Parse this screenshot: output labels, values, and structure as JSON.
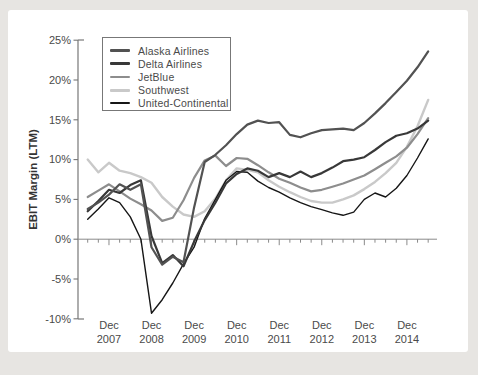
{
  "page": {
    "background": "#e7e5e2",
    "card_background": "#ffffff"
  },
  "chart_data": {
    "type": "line",
    "title": "",
    "xlabel": "",
    "ylabel": "EBIT Margin (LTM)",
    "ylim": [
      -10,
      25
    ],
    "grid": "off",
    "legend_position": "top-left-inside",
    "y_ticks": [
      {
        "value": 25,
        "label": "25%"
      },
      {
        "value": 20,
        "label": "20%"
      },
      {
        "value": 15,
        "label": "15%"
      },
      {
        "value": 10,
        "label": "10%"
      },
      {
        "value": 5,
        "label": "5%"
      },
      {
        "value": 0,
        "label": "0%"
      },
      {
        "value": -5,
        "label": "-5%"
      },
      {
        "value": -10,
        "label": "-10%"
      }
    ],
    "x_ticks": [
      {
        "month": "Dec",
        "year": "2007"
      },
      {
        "month": "Dec",
        "year": "2008"
      },
      {
        "month": "Dec",
        "year": "2009"
      },
      {
        "month": "Dec",
        "year": "2010"
      },
      {
        "month": "Dec",
        "year": "2011"
      },
      {
        "month": "Dec",
        "year": "2012"
      },
      {
        "month": "Dec",
        "year": "2013"
      },
      {
        "month": "Dec",
        "year": "2014"
      }
    ],
    "categories": [
      "Jun-07",
      "Sep-07",
      "Dec-07",
      "Mar-08",
      "Jun-08",
      "Sep-08",
      "Dec-08",
      "Mar-09",
      "Jun-09",
      "Sep-09",
      "Dec-09",
      "Mar-10",
      "Jun-10",
      "Sep-10",
      "Dec-10",
      "Mar-11",
      "Jun-11",
      "Sep-11",
      "Dec-11",
      "Mar-12",
      "Jun-12",
      "Sep-12",
      "Dec-12",
      "Mar-13",
      "Jun-13",
      "Sep-13",
      "Dec-13",
      "Mar-14",
      "Jun-14",
      "Sep-14",
      "Dec-14",
      "Mar-15",
      "Jun-15"
    ],
    "series": [
      {
        "name": "Alaska Airlines",
        "color": "#525252",
        "line_width": 2.2,
        "swatch_height": 2.6,
        "values": [
          3.8,
          4.6,
          5.6,
          6.9,
          6.2,
          6.9,
          -1.0,
          -3.2,
          -2.2,
          -2.9,
          4.0,
          9.7,
          10.6,
          11.8,
          13.2,
          14.4,
          14.9,
          14.6,
          14.7,
          13.1,
          12.8,
          13.3,
          13.7,
          13.8,
          13.9,
          13.7,
          14.6,
          15.8,
          17.1,
          18.5,
          19.9,
          21.6,
          23.6
        ]
      },
      {
        "name": "Delta Airlines",
        "color": "#383838",
        "line_width": 2.2,
        "swatch_height": 2.6,
        "values": [
          3.5,
          4.8,
          6.2,
          5.8,
          6.8,
          7.4,
          0.4,
          -3.0,
          -2.0,
          -3.4,
          -0.3,
          2.4,
          4.6,
          7.0,
          8.2,
          8.9,
          8.6,
          7.8,
          8.3,
          7.8,
          8.5,
          7.8,
          8.3,
          9.0,
          9.8,
          10.0,
          10.3,
          11.2,
          12.2,
          13.0,
          13.3,
          13.9,
          14.9
        ]
      },
      {
        "name": "JetBlue",
        "color": "#8d8d8d",
        "line_width": 2.2,
        "swatch_height": 2.6,
        "values": [
          5.3,
          6.1,
          6.9,
          6.0,
          5.1,
          4.4,
          3.6,
          2.3,
          2.7,
          4.9,
          7.7,
          9.9,
          10.5,
          9.2,
          10.2,
          10.1,
          9.3,
          8.4,
          7.6,
          7.1,
          6.5,
          6.0,
          6.2,
          6.6,
          7.0,
          7.5,
          8.0,
          8.8,
          9.6,
          10.4,
          11.5,
          13.2,
          15.2
        ]
      },
      {
        "name": "Southwest",
        "color": "#c9c9c9",
        "line_width": 2.4,
        "swatch_height": 2.8,
        "values": [
          10.0,
          8.4,
          9.6,
          8.6,
          8.3,
          7.8,
          7.1,
          5.3,
          4.1,
          3.1,
          2.8,
          3.5,
          5.1,
          7.4,
          8.9,
          8.7,
          8.4,
          7.4,
          6.6,
          5.9,
          5.3,
          4.8,
          4.6,
          4.6,
          5.0,
          5.5,
          6.3,
          7.2,
          8.3,
          9.6,
          11.6,
          14.2,
          17.5
        ]
      },
      {
        "name": "United-Continental",
        "color": "#161616",
        "line_width": 1.4,
        "swatch_height": 1.8,
        "values": [
          2.5,
          3.8,
          5.2,
          4.6,
          2.8,
          0.0,
          -9.3,
          -7.6,
          -5.5,
          -3.1,
          -1.0,
          2.6,
          5.0,
          7.4,
          8.5,
          8.4,
          7.3,
          6.5,
          5.9,
          5.2,
          4.6,
          4.1,
          3.7,
          3.3,
          3.0,
          3.4,
          5.0,
          5.8,
          5.3,
          6.4,
          8.0,
          10.2,
          12.6
        ]
      }
    ]
  }
}
